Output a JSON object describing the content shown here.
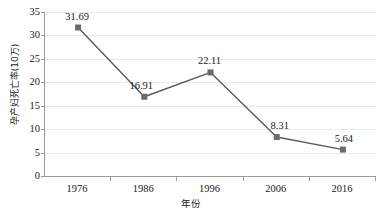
{
  "chart_data": {
    "type": "line",
    "title": "",
    "xlabel": "年份",
    "ylabel": "孕产妇死亡率(10万)",
    "categories": [
      "1976",
      "1986",
      "1996",
      "2006",
      "2016"
    ],
    "values": [
      31.69,
      16.91,
      22.11,
      8.31,
      5.64
    ],
    "data_labels": [
      "31.69",
      "16.91",
      "22.11",
      "8.31",
      "5.64"
    ],
    "series": [
      {
        "name": "孕产妇死亡率",
        "values": [
          31.69,
          16.91,
          22.11,
          8.31,
          5.64
        ]
      }
    ],
    "ylim": [
      0,
      35
    ],
    "yticks": [
      "0",
      "5",
      "10",
      "15",
      "20",
      "25",
      "30",
      "35"
    ],
    "ytick_values": [
      0,
      5,
      10,
      15,
      20,
      25,
      30,
      35
    ],
    "grid": "horizontal",
    "legend": "none",
    "colors": {
      "line": "#5a5a5a",
      "marker": "#6b6b6b",
      "gridline": "#e8eaec",
      "axis": "#9a9a9a",
      "text": "#1a1a1a",
      "background": "#ffffff"
    }
  }
}
